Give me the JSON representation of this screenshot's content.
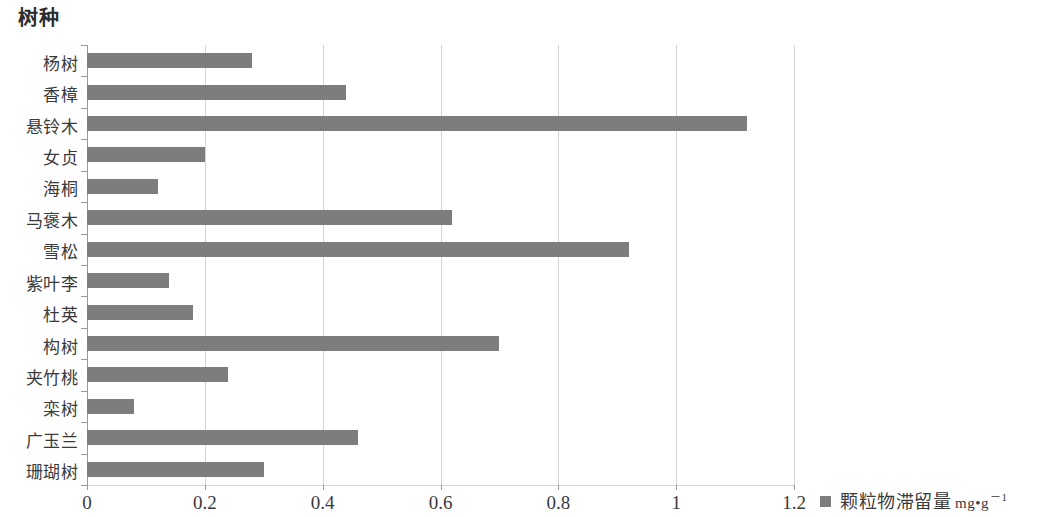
{
  "chart_data": {
    "type": "bar",
    "orientation": "horizontal",
    "title": "树种",
    "xlabel": "",
    "ylabel": "",
    "xlim": [
      0,
      1.2
    ],
    "xticks": [
      "0",
      "0.2",
      "0.4",
      "0.6",
      "0.8",
      "1",
      "1.2"
    ],
    "xtick_values": [
      0,
      0.2,
      0.4,
      0.6,
      0.8,
      1,
      1.2
    ],
    "grid": true,
    "grid_axis": "x",
    "legend_position": "bottom-right",
    "legend": [
      "颗粒物滞留量 mg•g⁻¹"
    ],
    "series_name": "颗粒物滞留量",
    "series_unit": "mg•g",
    "series_unit_exponent": "－1",
    "bar_color": "#7d7d7d",
    "categories": [
      "杨树",
      "香樟",
      "悬铃木",
      "女贞",
      "海桐",
      "马褒木",
      "雪松",
      "紫叶李",
      "杜英",
      "构树",
      "夹竹桃",
      "栾树",
      "广玉兰",
      "珊瑚树"
    ],
    "values": [
      0.28,
      0.44,
      1.12,
      0.2,
      0.12,
      0.62,
      0.92,
      0.14,
      0.18,
      0.7,
      0.24,
      0.08,
      0.46,
      0.3
    ]
  }
}
